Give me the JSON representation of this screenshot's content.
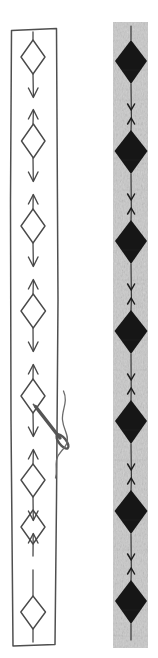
{
  "figure": {
    "background_color": "#ffffff",
    "width": 158,
    "height": 658,
    "panels": [
      {
        "id": "left-panel",
        "name": "hand-drawn-outline-strip",
        "style": "line-drawing",
        "stroke_color": "#4a4a4a",
        "fill_color": "#ffffff",
        "x": 10,
        "y": 28,
        "width": 48,
        "height": 618,
        "motif": "open-diamond",
        "motif_count": 8,
        "motif_fill": "none",
        "arrow_pattern": "alternating-down-up",
        "arrow_count": 14,
        "motif_centers_y": [
          57,
          141,
          226,
          311,
          396,
          480,
          527,
          612
        ],
        "motif_width": 24,
        "motif_height": 34,
        "center_x": 33,
        "has_needle": true
      },
      {
        "id": "right-panel",
        "name": "grey-textured-strip",
        "style": "photographic-texture",
        "background_color": "#c9c9c9",
        "texture_color": "#b5b5b5",
        "x": 113,
        "y": 22,
        "width": 35,
        "height": 626,
        "motif": "solid-diamond",
        "motif_count": 7,
        "motif_fill": "#141414",
        "arrow_pattern": "alternating-down-up",
        "arrow_count": 12,
        "motif_centers_y": [
          62,
          152,
          242,
          332,
          422,
          512,
          602
        ],
        "motif_width": 30,
        "motif_height": 44,
        "center_x": 131,
        "has_needle": false
      }
    ],
    "needle": {
      "name": "sewing-needle",
      "color": "#5a5a5a",
      "thread_color": "#6b6b6b",
      "tip_x": 36,
      "tip_y": 407,
      "eye_x": 62,
      "eye_y": 441,
      "angle_degrees": 52,
      "description": "needle piercing the left strip with curling thread"
    }
  }
}
